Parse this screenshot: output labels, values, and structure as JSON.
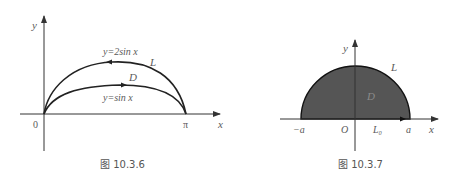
{
  "figures": [
    {
      "id": "fig-10-3-6",
      "caption": "图 10.3.6",
      "axes": {
        "x_label": "x",
        "y_label": "y",
        "origin_label": "0",
        "x_tick_label": "π"
      },
      "curves": [
        {
          "name": "L",
          "equation_label": "y=2sin x",
          "label": "L"
        },
        {
          "name": "inner",
          "equation_label": "y=sin x"
        }
      ],
      "region_label": "D"
    },
    {
      "id": "fig-10-3-7",
      "caption": "图 10.3.7",
      "axes": {
        "x_label": "x",
        "y_label": "y",
        "origin_label": "O",
        "x_tick_left": "−a",
        "x_tick_right": "a"
      },
      "curve_label": "L",
      "segment_label": "L₀",
      "region_label": "D",
      "fill_color": "#555555"
    }
  ]
}
